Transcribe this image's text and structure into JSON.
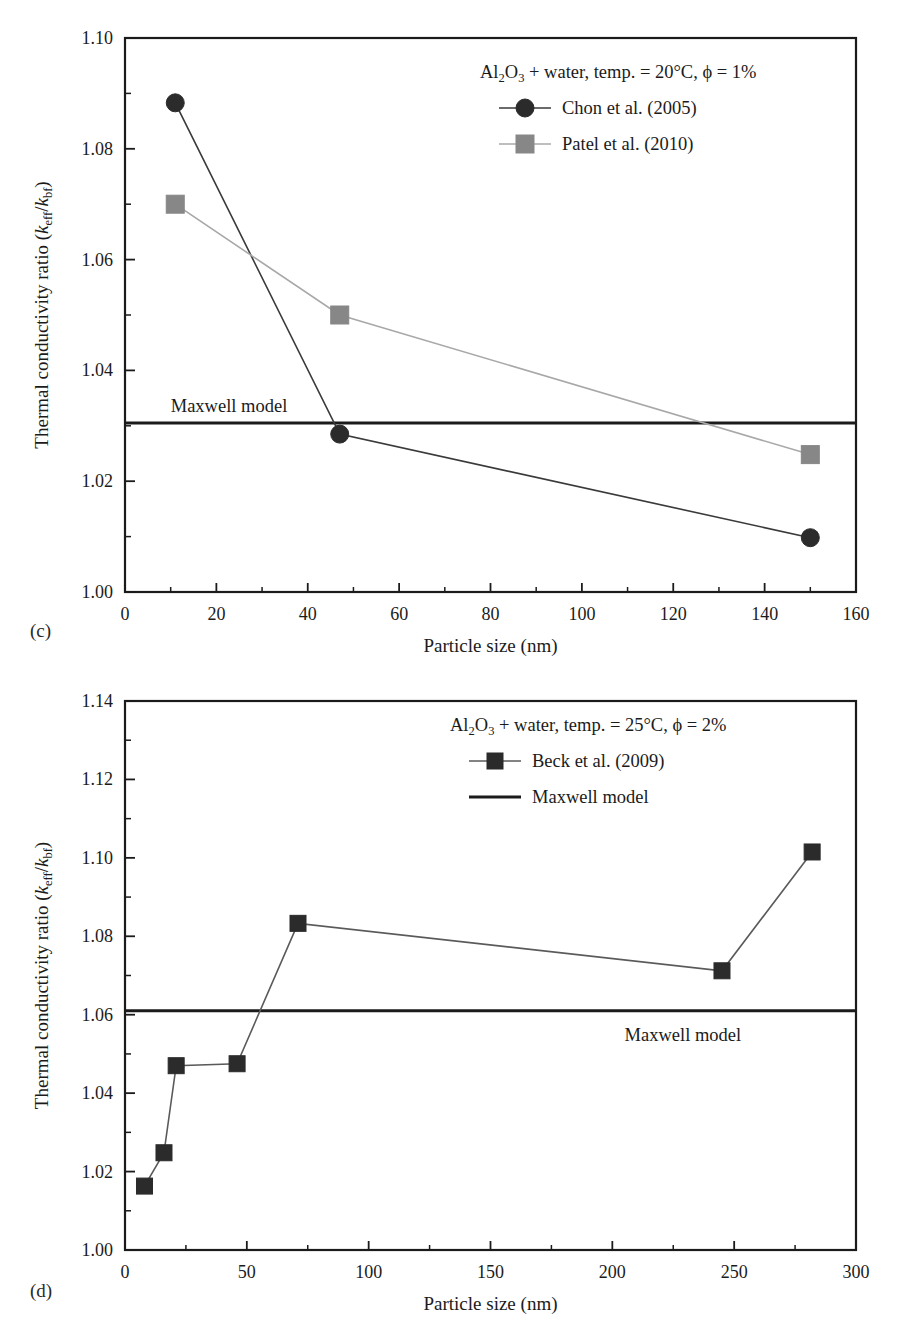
{
  "figure": {
    "panels": [
      {
        "id": "c",
        "label": "(c)",
        "chart_data": {
          "type": "line",
          "title": "",
          "subtitle": "",
          "xlabel": "Particle size (nm)",
          "ylabel": "Thermal conductivity ratio (k_eff/k_bf)",
          "ylabel_parts": {
            "main": "Thermal conductivity ratio (",
            "k1": "k",
            "sub1": "eff",
            "slash": "/",
            "k2": "k",
            "sub2": "bf",
            "close": ")"
          },
          "xlim": [
            0,
            160
          ],
          "ylim": [
            1.0,
            1.1
          ],
          "xticks": [
            0,
            20,
            40,
            60,
            80,
            100,
            120,
            140,
            160
          ],
          "yticks": [
            "1.00",
            "1.02",
            "1.04",
            "1.06",
            "1.08",
            "1.10"
          ],
          "ytick_values": [
            1.0,
            1.02,
            1.04,
            1.06,
            1.08,
            1.1
          ],
          "xminor_step": 10,
          "yminor_step": 0.01,
          "grid": false,
          "legend_position": "top-right",
          "condition": "Al2O3 + water, temp. = 20°C, ϕ = 1%",
          "condition_parts": {
            "al": "Al",
            "two": "2",
            "o": "O",
            "three": "3",
            "rest": " + water, temp. = 20°C, ϕ = 1%"
          },
          "series": [
            {
              "name": "Chon et al. (2005)",
              "marker": "circle",
              "marker_color": "#2b2b2b",
              "line_color": "#3a3a3a",
              "x": [
                11,
                47,
                150
              ],
              "values": [
                1.0883,
                1.0285,
                1.0098
              ]
            },
            {
              "name": "Patel et al. (2010)",
              "marker": "square",
              "marker_color": "#878787",
              "line_color": "#a8a8a8",
              "x": [
                11,
                47,
                150
              ],
              "values": [
                1.07,
                1.05,
                1.0248
              ]
            }
          ],
          "annotations": [
            {
              "text": "Maxwell model",
              "type": "hline-label",
              "y": 1.0305,
              "x_text": 10,
              "position": "above-left"
            }
          ],
          "reference_line": {
            "name": "Maxwell model",
            "value": 1.0305,
            "color": "#1b1b1b"
          }
        }
      },
      {
        "id": "d",
        "label": "(d)",
        "chart_data": {
          "type": "line",
          "title": "",
          "subtitle": "",
          "xlabel": "Particle size (nm)",
          "ylabel": "Thermal conductivity ratio (k_eff/k_bf)",
          "ylabel_parts": {
            "main": "Thermal conductivity ratio (",
            "k1": "k",
            "sub1": "eff",
            "slash": "/",
            "k2": "k",
            "sub2": "bf",
            "close": ")"
          },
          "xlim": [
            0,
            300
          ],
          "ylim": [
            1.0,
            1.14
          ],
          "xticks": [
            0,
            50,
            100,
            150,
            200,
            250,
            300
          ],
          "yticks": [
            "1.00",
            "1.02",
            "1.04",
            "1.06",
            "1.08",
            "1.10",
            "1.12",
            "1.14"
          ],
          "ytick_values": [
            1.0,
            1.02,
            1.04,
            1.06,
            1.08,
            1.1,
            1.12,
            1.14
          ],
          "xminor_step": 25,
          "yminor_step": 0.01,
          "grid": false,
          "legend_position": "top-right",
          "condition": "Al2O3 + water, temp. = 25°C, ϕ = 2%",
          "condition_parts": {
            "al": "Al",
            "two": "2",
            "o": "O",
            "three": "3",
            "rest": " + water, temp. = 25°C, ϕ = 2%"
          },
          "series": [
            {
              "name": "Beck et al. (2009)",
              "marker": "square",
              "marker_color": "#2b2b2b",
              "line_color": "#5a5a5a",
              "x": [
                8,
                16,
                21,
                46,
                71,
                245,
                282
              ],
              "values": [
                1.0163,
                1.0248,
                1.047,
                1.0475,
                1.0833,
                1.0712,
                1.1015
              ]
            }
          ],
          "annotations": [
            {
              "text": "Maxwell model",
              "type": "hline-label",
              "y": 1.061,
              "x_text": 205,
              "position": "below-right"
            }
          ],
          "reference_line": {
            "name": "Maxwell model",
            "value": 1.061,
            "color": "#1b1b1b"
          },
          "legend_entries": [
            {
              "name": "Beck et al. (2009)",
              "marker": "square"
            },
            {
              "name": "Maxwell model",
              "marker": "line"
            }
          ]
        }
      }
    ]
  }
}
